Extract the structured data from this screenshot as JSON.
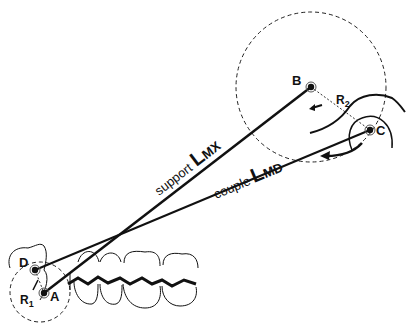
{
  "diagram": {
    "type": "biomechanics-lever-diagram",
    "points": {
      "A": {
        "label": "A",
        "x": 44,
        "y": 293
      },
      "B": {
        "label": "B",
        "x": 311,
        "y": 87
      },
      "C": {
        "label": "C",
        "x": 370,
        "y": 130
      },
      "D": {
        "label": "D",
        "x": 35,
        "y": 270
      }
    },
    "radii": {
      "r1": {
        "label": "R",
        "sub": "1"
      },
      "r2": {
        "label": "R",
        "sub": "2"
      }
    },
    "lines": {
      "support": {
        "word": "support",
        "symbol": "L",
        "sub": "MX"
      },
      "couple": {
        "word": "couple",
        "symbol": "L",
        "sub": "MD"
      }
    },
    "colors": {
      "ink": "#111111",
      "background": "#ffffff"
    }
  }
}
